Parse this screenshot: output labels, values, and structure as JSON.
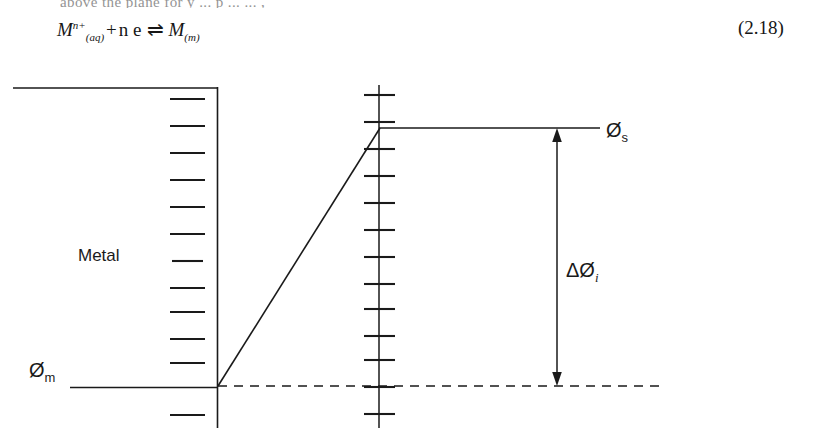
{
  "document": {
    "partial_text_above": "above the  plane    for    y    ... p ...   ... ,",
    "equation": {
      "lhs_symbol": "M",
      "lhs_superscript": "n+",
      "lhs_subscript": "(aq)",
      "plus": "+",
      "electrons": "n e",
      "arrow": "⇌",
      "rhs_symbol": "M",
      "rhs_subscript": "(m)",
      "plain_text": "M(aq)^n+ + n e ⇌ M(m)"
    },
    "equation_number": "(2.18)"
  },
  "figure": {
    "labels": {
      "metal": "Metal",
      "phi_metal_symbol": "Ø",
      "phi_metal_subscript": "m",
      "phi_solution_symbol": "Ø",
      "phi_solution_subscript": "s",
      "delta_phi_symbol": "ΔØ",
      "delta_phi_subscript": "i"
    },
    "charges": {
      "negative_glyph": "−",
      "negative_count": 12,
      "positive_glyph": "+",
      "positive_count": 13
    },
    "colors": {
      "line": "#1a1a1a",
      "background": "#ffffff",
      "text": "#1a1a1a"
    },
    "geometry": {
      "metal_top_line": {
        "x1": 13,
        "y1": 88,
        "x2": 217,
        "y2": 88
      },
      "metal_interface_line": {
        "x1": 217,
        "y1": 88,
        "x2": 217,
        "y2": 428
      },
      "phi_metal_level_line": {
        "x1": 70,
        "y1": 387,
        "x2": 218,
        "y2": 387
      },
      "helmholtz_plane_line": {
        "x1": 379,
        "y1": 85,
        "x2": 379,
        "y2": 428
      },
      "potential_ramp": {
        "x1": 218,
        "y1": 386,
        "x2": 380,
        "y2": 128
      },
      "phi_solution_level_line": {
        "x1": 380,
        "y1": 128,
        "x2": 600,
        "y2": 128
      },
      "bulk_reference_dashed_line": {
        "x1": 218,
        "y1": 386,
        "x2": 660,
        "y2": 386
      },
      "delta_phi_arrow": {
        "x": 557,
        "y_top": 131,
        "y_bottom": 383
      },
      "negative_sign_y_positions": [
        99,
        126,
        153,
        180,
        207,
        234,
        261,
        288,
        312,
        339,
        363,
        415
      ],
      "negative_sign_x": [
        170,
        205
      ],
      "positive_sign_y_positions": [
        95,
        122,
        149,
        176,
        203,
        230,
        257,
        284,
        309,
        336,
        360,
        387,
        414
      ],
      "positive_sign_x": [
        364,
        394
      ]
    }
  }
}
